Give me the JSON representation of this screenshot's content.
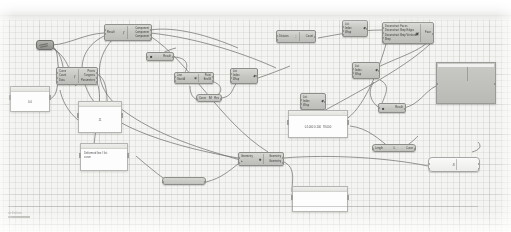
{
  "app": {
    "title": "Grasshopper Canvas",
    "zoom_level": "",
    "status_text": "definition"
  },
  "ribbon": {
    "label": ""
  },
  "colors": {
    "canvas_bg": "#f4f4f2",
    "grid_line": "#b4b4af",
    "node_fill": "#c6c6c2",
    "node_border": "#8d8d8a",
    "panel_fill": "#fdfdfd",
    "wire": "#6f6f6f",
    "text": "#3a3a38"
  },
  "nodes": [
    {
      "id": "knob",
      "name": "number-slider-knob",
      "label": ""
    },
    {
      "id": "expression",
      "name": "expression-component",
      "glyph": "ƒ",
      "inputs": [
        "Result"
      ],
      "outputs": [
        "Component",
        "Component",
        "Component"
      ]
    },
    {
      "id": "evaluate",
      "name": "evaluate-component",
      "glyph": "ƒ",
      "inputs": [
        "Curve",
        "Count",
        "Data"
      ],
      "outputs": [
        "Points",
        "Tangents",
        "Parameters"
      ]
    },
    {
      "id": "panel-a",
      "name": "panel-value-a",
      "cap": "...",
      "text": "0.0"
    },
    {
      "id": "panel-b",
      "name": "panel-value-b",
      "cap": "...",
      "text": "11"
    },
    {
      "id": "panel-c",
      "name": "panel-text-c",
      "cap": "...",
      "text": "Deformed line / list\ncurve"
    },
    {
      "id": "result-small",
      "name": "result-component",
      "glyph": "■",
      "inputs": [],
      "outputs": [
        "Result"
      ]
    },
    {
      "id": "line-a",
      "name": "line-component",
      "glyph": "✶",
      "inputs": [
        "Line",
        "Start A"
      ],
      "outputs": [
        "Point",
        "End B"
      ]
    },
    {
      "id": "list-a",
      "name": "list-item-component",
      "glyph": "◆",
      "inputs": [
        "List",
        "Index",
        "Wrap"
      ],
      "outputs": [
        "i"
      ]
    },
    {
      "id": "merge-a",
      "name": "merge-component",
      "glyph": "M",
      "inputs": [
        "Curve"
      ],
      "outputs": [
        "Res"
      ]
    },
    {
      "id": "division",
      "name": "division-component",
      "glyph": "÷",
      "inputs": [
        "Division"
      ],
      "outputs": [
        "Count"
      ]
    },
    {
      "id": "list-b",
      "name": "list-item-component-b",
      "glyph": "◆",
      "inputs": [
        "List",
        "Index",
        "Wrap"
      ],
      "outputs": []
    },
    {
      "id": "list-c",
      "name": "list-item-component-c",
      "glyph": "◆",
      "inputs": [
        "List",
        "Index",
        "Wrap"
      ],
      "outputs": []
    },
    {
      "id": "deconstruct",
      "name": "deconstruct-brep-component",
      "glyph": "▣",
      "inputs": [
        "Deconstruct Faces",
        "Deconstruct Brep Edges",
        "Deconstruct Brep Vertices",
        "Brep"
      ],
      "outputs": [
        "Face"
      ]
    },
    {
      "id": "list-d",
      "name": "list-item-component-d",
      "glyph": "◆",
      "inputs": [
        "List",
        "Index",
        "Wrap"
      ],
      "outputs": []
    },
    {
      "id": "result-b",
      "name": "result-component-b",
      "glyph": "■",
      "inputs": [],
      "outputs": [
        "Result"
      ]
    },
    {
      "id": "bigblock",
      "name": "geometry-preview-block",
      "label": ""
    },
    {
      "id": "pill-length",
      "name": "length-component",
      "glyph": "L",
      "left": "Length",
      "right": "Curve"
    },
    {
      "id": "pill-cluster",
      "name": "cluster-component",
      "glyph": "●",
      "left": "Geometry",
      "right": "Geometry"
    },
    {
      "id": "pill-divide",
      "name": "divide-curve-component",
      "glyph": "÷",
      "left": "Curve",
      "right": "Count"
    },
    {
      "id": "pill-scale",
      "name": "scale-component",
      "glyph": "S",
      "left": "Scale",
      "right": "Geometry"
    },
    {
      "id": "transform",
      "name": "transform-component",
      "glyph": "↗",
      "inputs": [
        "Geometry",
        "Motion"
      ],
      "outputs": [
        "Geometry",
        "Transform"
      ]
    },
    {
      "id": "panel-d",
      "name": "panel-list-d",
      "cap": "...",
      "text": "0.1000 0.100  78.000"
    },
    {
      "id": "panel-e",
      "name": "panel-value-e",
      "cap": "",
      "text": "100"
    }
  ],
  "wires": {
    "count": 26,
    "color": "#6f6f6f"
  }
}
